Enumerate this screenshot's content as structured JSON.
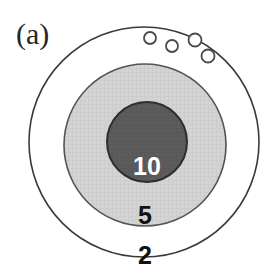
{
  "figure": {
    "panel_label": "(a)",
    "type": "concentric-zone-schematic",
    "background_color": "#ffffff"
  },
  "zones": [
    {
      "name": "outer-zone",
      "label": "2",
      "fill_color": "#ffffff",
      "outline_color": "#3a3a3a",
      "label_color": "#111111",
      "cx": 144,
      "cy": 142,
      "r": 115
    },
    {
      "name": "middle-zone",
      "label": "5",
      "fill_color": "#d2d2d2",
      "outline_color": "#545454",
      "label_color": "#111111",
      "cx": 145,
      "cy": 145,
      "r": 81
    },
    {
      "name": "inner-zone",
      "label": "10",
      "fill_color": "#5c5c5c",
      "outline_color": "#2e2e2e",
      "label_color": "#ffffff",
      "cx": 147,
      "cy": 142,
      "r": 40
    }
  ],
  "zone_labels": {
    "inner": "10",
    "middle": "5",
    "outer": "2"
  },
  "pores": {
    "name": "small-open-circles",
    "count": 4,
    "fill_color": "#ffffff",
    "outline_color": "#4a4a4a",
    "items": [
      {
        "cx": 150,
        "cy": 38,
        "r": 6
      },
      {
        "cx": 172,
        "cy": 45,
        "r": 6
      },
      {
        "cx": 195,
        "cy": 40,
        "r": 6
      },
      {
        "cx": 207,
        "cy": 55,
        "r": 6
      }
    ]
  },
  "label_positions": {
    "panel": {
      "x": 16,
      "y": 42
    },
    "inner": {
      "x": 147,
      "y": 172
    },
    "middle": {
      "x": 145,
      "y": 222
    },
    "outer": {
      "x": 145,
      "y": 261
    }
  }
}
